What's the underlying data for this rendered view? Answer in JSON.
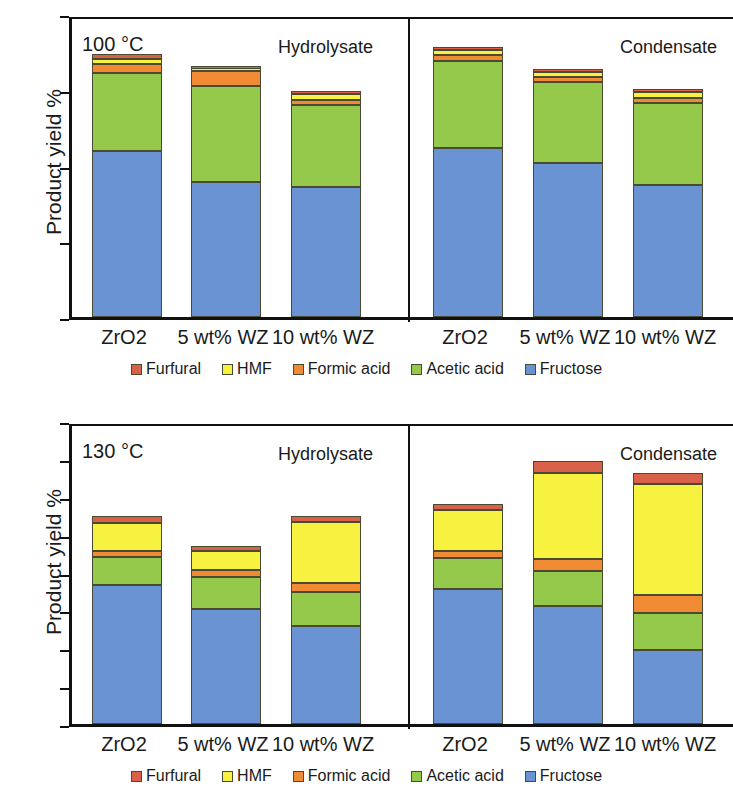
{
  "chart_data": [
    {
      "type": "bar",
      "subtype": "stacked",
      "panel_id": "top",
      "title": "",
      "temperature_label": "100 °C",
      "xlabel": "",
      "ylabel": "Product yield %",
      "ylim": [
        0,
        16
      ],
      "yticks": [
        0,
        4,
        8,
        12,
        16
      ],
      "ytick_labels": [
        "0",
        "4",
        "8",
        "12",
        "16"
      ],
      "grid": false,
      "legend_position": "bottom",
      "groups": [
        {
          "name": "Hydrolysate",
          "categories": [
            "ZrO2",
            "5 wt% WZ",
            "10 wt% WZ"
          ]
        },
        {
          "name": "Condensate",
          "categories": [
            "ZrO2",
            "5 wt% WZ",
            "10 wt% WZ"
          ]
        }
      ],
      "categories": [
        "ZrO2",
        "5 wt% WZ",
        "10 wt% WZ",
        "ZrO2",
        "5 wt% WZ",
        "10 wt% WZ"
      ],
      "series": [
        {
          "name": "Fructose",
          "color": "#6a93d4",
          "values": [
            8.75,
            7.15,
            6.85,
            8.95,
            8.15,
            6.95
          ]
        },
        {
          "name": "Acetic acid",
          "color": "#95c94b",
          "values": [
            4.15,
            5.05,
            4.35,
            4.55,
            4.25,
            4.35
          ]
        },
        {
          "name": "Formic acid",
          "color": "#f08a33",
          "values": [
            0.45,
            0.8,
            0.25,
            0.35,
            0.25,
            0.25
          ]
        },
        {
          "name": "HMF",
          "color": "#f7f240",
          "values": [
            0.25,
            0.1,
            0.35,
            0.25,
            0.3,
            0.35
          ]
        },
        {
          "name": "Furfural",
          "color": "#d9614a",
          "values": [
            0.3,
            0.15,
            0.15,
            0.15,
            0.15,
            0.15
          ]
        }
      ],
      "totals": [
        13.9,
        13.25,
        11.95,
        14.25,
        13.1,
        12.05
      ]
    },
    {
      "type": "bar",
      "subtype": "stacked",
      "panel_id": "bottom",
      "title": "",
      "temperature_label": "130 °C",
      "xlabel": "",
      "ylabel": "Product yield %",
      "ylim": [
        0,
        40
      ],
      "yticks": [
        0,
        5,
        10,
        15,
        20,
        25,
        30,
        35,
        40
      ],
      "ytick_labels": [
        "0",
        "5",
        "10",
        "15",
        "20",
        "25",
        "30",
        "35",
        "40"
      ],
      "grid": false,
      "legend_position": "bottom",
      "groups": [
        {
          "name": "Hydrolysate",
          "categories": [
            "ZrO2",
            "5 wt% WZ",
            "10 wt% WZ"
          ]
        },
        {
          "name": "Condensate",
          "categories": [
            "ZrO2",
            "5 wt% WZ",
            "10 wt% WZ"
          ]
        }
      ],
      "categories": [
        "ZrO2",
        "5 wt% WZ",
        "10 wt% WZ",
        "ZrO2",
        "5 wt% WZ",
        "10 wt% WZ"
      ],
      "series": [
        {
          "name": "Fructose",
          "color": "#6a93d4",
          "values": [
            18.3,
            15.2,
            13.0,
            17.8,
            15.6,
            9.8
          ]
        },
        {
          "name": "Acetic acid",
          "color": "#95c94b",
          "values": [
            3.7,
            4.2,
            4.4,
            4.1,
            4.6,
            4.8
          ]
        },
        {
          "name": "Formic acid",
          "color": "#f08a33",
          "values": [
            0.9,
            0.9,
            1.2,
            1.0,
            1.6,
            2.4
          ]
        },
        {
          "name": "HMF",
          "color": "#f7f240",
          "values": [
            3.7,
            2.6,
            8.1,
            5.3,
            11.4,
            14.7
          ]
        },
        {
          "name": "Furfural",
          "color": "#d9614a",
          "values": [
            0.9,
            0.6,
            0.7,
            0.9,
            1.5,
            1.5
          ]
        }
      ],
      "totals": [
        27.5,
        23.5,
        27.4,
        29.1,
        34.7,
        33.2
      ]
    }
  ],
  "panels": [
    {
      "id": "top",
      "temperature": "100 °C",
      "ylabel": "Product yield %",
      "yticks": [
        "16",
        "12",
        "8",
        "4",
        "0"
      ],
      "group_left": "Hydrolysate",
      "group_right": "Condensate",
      "xlabels": [
        "ZrO2",
        "5 wt% WZ",
        "10 wt% WZ",
        "ZrO2",
        "5 wt% WZ",
        "10 wt% WZ"
      ]
    },
    {
      "id": "bottom",
      "temperature": "130 °C",
      "ylabel": "Product yield %",
      "yticks": [
        "40",
        "35",
        "30",
        "25",
        "20",
        "15",
        "10",
        "5",
        "0"
      ],
      "group_left": "Hydrolysate",
      "group_right": "Condensate",
      "xlabels": [
        "ZrO2",
        "5 wt% WZ",
        "10 wt% WZ",
        "ZrO2",
        "5 wt% WZ",
        "10 wt% WZ"
      ]
    }
  ],
  "legend": {
    "items": [
      {
        "label": "Furfural",
        "color": "#d9614a"
      },
      {
        "label": "HMF",
        "color": "#f7f240"
      },
      {
        "label": "Formic acid",
        "color": "#f08a33"
      },
      {
        "label": "Acetic acid",
        "color": "#95c94b"
      },
      {
        "label": "Fructose",
        "color": "#6a93d4"
      }
    ]
  },
  "colors": {
    "furfural": "#d9614a",
    "hmf": "#f7f240",
    "formic_acid": "#f08a33",
    "acetic_acid": "#95c94b",
    "fructose": "#6a93d4",
    "axis": "#111111",
    "background": "#ffffff"
  }
}
